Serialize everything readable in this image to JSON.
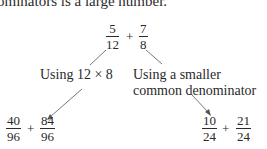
{
  "intro_text": "ominators is a large number.",
  "root_expression": {
    "left": {
      "num": "5",
      "den": "12"
    },
    "operator": "+",
    "right": {
      "num": "7",
      "den": "8"
    }
  },
  "branches": {
    "left": {
      "label": "Using 12 × 8",
      "result": {
        "left": {
          "num": "40",
          "den": "96"
        },
        "operator": "+",
        "right": {
          "num": "84",
          "den": "96"
        }
      }
    },
    "right": {
      "label_line1": "Using a smaller",
      "label_line2": "common denominator",
      "result": {
        "left": {
          "num": "10",
          "den": "24"
        },
        "operator": "+",
        "right": {
          "num": "21",
          "den": "24"
        }
      }
    }
  }
}
